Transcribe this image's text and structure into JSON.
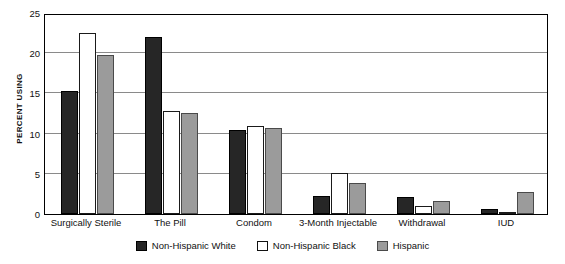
{
  "chart_data": {
    "type": "bar",
    "title": "",
    "subtitle": "",
    "xlabel": "",
    "ylabel": "PERCENT USING",
    "ylim": [
      0,
      25
    ],
    "yticks": [
      0,
      5,
      10,
      15,
      20,
      25
    ],
    "ytick_labels": [
      "0",
      "5",
      "10",
      "15",
      "20",
      "25"
    ],
    "grid": true,
    "grid_axis": "y",
    "legend_position": "bottom-center",
    "categories": [
      "Surgically Sterile",
      "The Pill",
      "Condom",
      "3-Month Injectable",
      "Withdrawal",
      "IUD"
    ],
    "series": [
      {
        "name": "Non-Hispanic White",
        "color": "#262626",
        "values": [
          15.3,
          22.0,
          10.4,
          2.3,
          2.1,
          0.6
        ]
      },
      {
        "name": "Non-Hispanic Black",
        "color": "#ffffff",
        "values": [
          22.5,
          12.8,
          11.0,
          5.1,
          1.0,
          0.1
        ]
      },
      {
        "name": "Hispanic",
        "color": "#9b9b9b",
        "values": [
          19.8,
          12.6,
          10.7,
          3.8,
          1.6,
          2.7
        ]
      }
    ]
  }
}
